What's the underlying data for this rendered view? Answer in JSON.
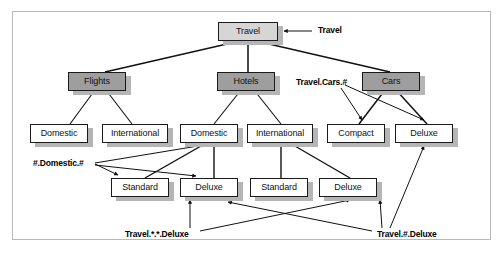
{
  "figure": {
    "border_color": "#b9b9b9",
    "node_fill_root": "#d6d6d6",
    "node_fill_level1": "#9e9e9e",
    "node_fill_leaf": "#ffffff",
    "node_border_color": "#1a1a1a",
    "shadow_color": "#b5b5b5"
  },
  "nodes": {
    "root": {
      "label": "Travel"
    },
    "flights": {
      "label": "Flights"
    },
    "hotels": {
      "label": "Hotels"
    },
    "cars": {
      "label": "Cars"
    },
    "flights_domestic": {
      "label": "Domestic"
    },
    "flights_international": {
      "label": "International"
    },
    "hotels_domestic": {
      "label": "Domestic"
    },
    "hotels_international": {
      "label": "International"
    },
    "cars_compact": {
      "label": "Compact"
    },
    "cars_deluxe": {
      "label": "Deluxe"
    },
    "hd_standard": {
      "label": "Standard"
    },
    "hd_deluxe": {
      "label": "Deluxe"
    },
    "hi_standard": {
      "label": "Standard"
    },
    "hi_deluxe": {
      "label": "Deluxe"
    }
  },
  "annotations": {
    "travel": {
      "label": "Travel"
    },
    "travel_cars_hash": {
      "label": "Travel.Cars.#"
    },
    "hash_domestic_hash": {
      "label": "#.Domestic.#"
    },
    "travel_star_star_deluxe": {
      "label": "Travel.*.*.Deluxe"
    },
    "travel_hash_deluxe": {
      "label": "Travel.#.Deluxe"
    }
  }
}
